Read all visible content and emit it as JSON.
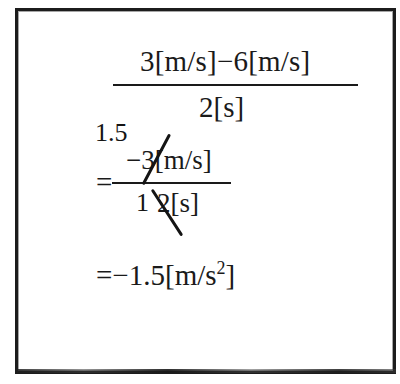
{
  "document": {
    "type": "handwritten-math-worksheet",
    "background_color": "#ffffff",
    "ink_color": "#1a1a1a",
    "border_color": "#1c1c1c"
  },
  "equation": {
    "line1": {
      "numerator": "3[m/s]−6[m/s]",
      "denominator": "2[s]"
    },
    "line2": {
      "equals": "=",
      "numerator": "−3[m/s]",
      "denominator": "2[s]",
      "annotation_above_numerator": "1.5",
      "annotation_before_denominator": "1",
      "numerator_cancelled": "3",
      "denominator_cancelled": "2"
    },
    "line3": {
      "equals": "=",
      "value": "−1.5",
      "unit_open": "[m/s",
      "unit_exponent": "2",
      "unit_close": "]",
      "full_text": "=−1.5[m/s²]"
    }
  }
}
